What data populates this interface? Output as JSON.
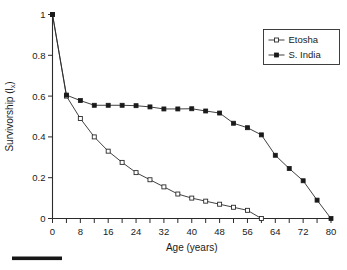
{
  "chart_data": {
    "type": "line",
    "title": "",
    "xlabel": "Age (years)",
    "ylabel": "Survivorship (lx)",
    "ylabel_main": "Survivorship (l",
    "ylabel_sub": "x",
    "ylabel_tail": ")",
    "xlim": [
      0,
      80
    ],
    "ylim": [
      0,
      1
    ],
    "xticks": [
      0,
      8,
      16,
      24,
      32,
      40,
      48,
      56,
      64,
      72,
      80
    ],
    "xtick_labels": [
      "0",
      "8",
      "16",
      "24",
      "32",
      "40",
      "48",
      "56",
      "64",
      "72",
      "80"
    ],
    "xminor_step": 4,
    "yticks": [
      0,
      0.2,
      0.4,
      0.6,
      0.8,
      1
    ],
    "ytick_labels": [
      "0",
      "0.2",
      "0.4",
      "0.6",
      "0.8",
      "1"
    ],
    "grid": false,
    "legend_position": "top-right",
    "x": [
      0,
      4,
      8,
      12,
      16,
      20,
      24,
      28,
      32,
      36,
      40,
      44,
      48,
      52,
      56,
      60,
      64,
      68,
      72,
      76,
      80
    ],
    "series": [
      {
        "name": "Etosha",
        "marker": "open-square",
        "x": [
          0,
          4,
          8,
          12,
          16,
          20,
          24,
          28,
          32,
          36,
          40,
          44,
          48,
          52,
          56,
          60
        ],
        "values": [
          1.0,
          0.6,
          0.49,
          0.4,
          0.33,
          0.275,
          0.225,
          0.19,
          0.155,
          0.12,
          0.1,
          0.085,
          0.07,
          0.055,
          0.04,
          0.0
        ]
      },
      {
        "name": "S. India",
        "marker": "filled-square",
        "x": [
          0,
          4,
          8,
          12,
          16,
          20,
          24,
          28,
          32,
          36,
          40,
          44,
          48,
          52,
          56,
          60,
          64,
          68,
          72,
          76,
          80
        ],
        "values": [
          1.0,
          0.605,
          0.578,
          0.555,
          0.555,
          0.555,
          0.553,
          0.547,
          0.537,
          0.537,
          0.538,
          0.527,
          0.517,
          0.467,
          0.445,
          0.41,
          0.31,
          0.245,
          0.185,
          0.09,
          0.0
        ]
      }
    ]
  },
  "legend": {
    "entries": [
      {
        "label": "Etosha",
        "marker": "open-square"
      },
      {
        "label": "S. India",
        "marker": "filled-square"
      }
    ]
  },
  "scalebar": {
    "visible": true
  }
}
